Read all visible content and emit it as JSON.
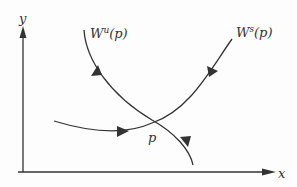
{
  "diagram": {
    "type": "phase-portrait",
    "axes": {
      "x_label": "x",
      "y_label": "y"
    },
    "labels": {
      "unstable_manifold": {
        "base": "W",
        "sup": "u",
        "arg": "(p)"
      },
      "stable_manifold": {
        "base": "W",
        "sup": "s",
        "arg": "(p)"
      },
      "fixed_point": "p"
    },
    "colors": {
      "stroke": "#333333",
      "background": "#fdfdfd"
    },
    "curves": [
      {
        "name": "unstable-manifold",
        "direction": "away-from-p",
        "arrows": 2
      },
      {
        "name": "stable-manifold",
        "direction": "toward-p",
        "arrows": 2
      }
    ]
  }
}
